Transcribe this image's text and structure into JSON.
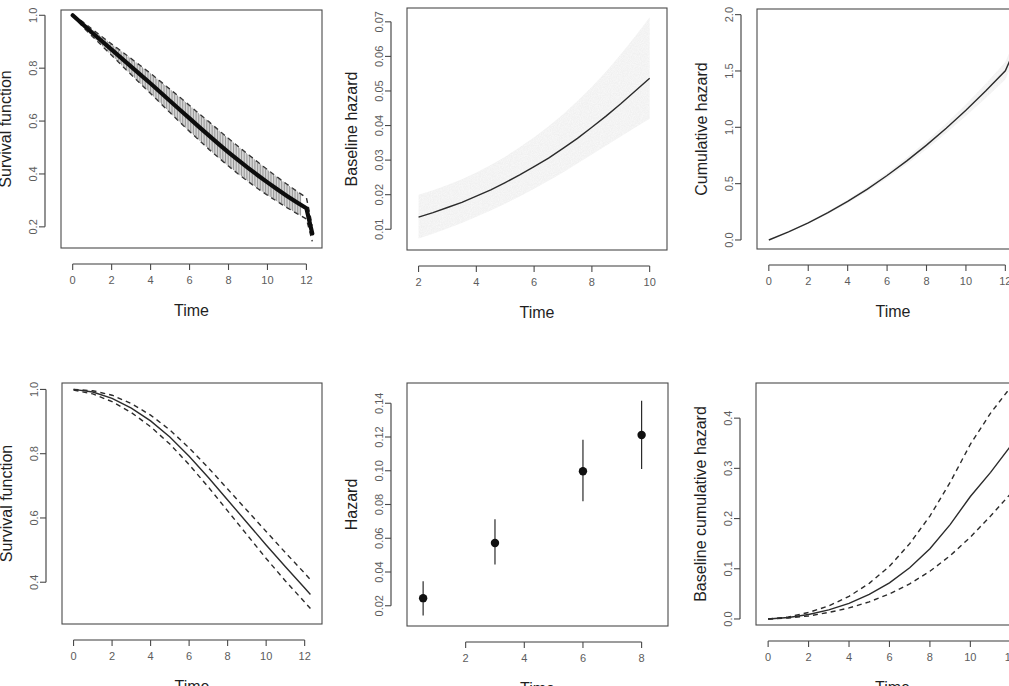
{
  "figure": {
    "panel_count": 6,
    "layout": "2 rows x 3 columns",
    "background": "#ffffff",
    "line_color": "#2b2b2b",
    "band_color": "#e9e9e9"
  },
  "chart_data": [
    {
      "id": "panel-1",
      "type": "line",
      "title": "",
      "xlabel": "Time",
      "ylabel": "Survival function",
      "xlim": [
        -0.6,
        12.8
      ],
      "ylim": [
        0.12,
        1.02
      ],
      "xticks": [
        0,
        2,
        4,
        6,
        8,
        10,
        12
      ],
      "xticklabels": [
        "0",
        "2",
        "4",
        "6",
        "8",
        "10",
        "12"
      ],
      "yticks": [
        0.2,
        0.4,
        0.6,
        0.8,
        1.0
      ],
      "yticklabels": [
        "0.2",
        "0.4",
        "0.6",
        "0.8",
        "1.0"
      ],
      "grid": false,
      "legend": "none",
      "style": "thick black curve with dense vertical error bars",
      "x": [
        0,
        0.5,
        1,
        1.5,
        2,
        2.5,
        3,
        3.5,
        4,
        4.5,
        5,
        5.5,
        6,
        6.5,
        7,
        7.5,
        8,
        8.5,
        9,
        9.5,
        10,
        10.5,
        11,
        11.5,
        12,
        12.3
      ],
      "values": [
        1.0,
        0.967,
        0.934,
        0.902,
        0.87,
        0.838,
        0.806,
        0.774,
        0.742,
        0.709,
        0.676,
        0.643,
        0.61,
        0.577,
        0.545,
        0.513,
        0.482,
        0.452,
        0.423,
        0.395,
        0.368,
        0.342,
        0.317,
        0.293,
        0.27,
        0.175
      ],
      "ci_lower": [
        1.0,
        0.958,
        0.921,
        0.885,
        0.849,
        0.812,
        0.776,
        0.74,
        0.704,
        0.668,
        0.632,
        0.596,
        0.561,
        0.527,
        0.493,
        0.461,
        0.43,
        0.4,
        0.372,
        0.345,
        0.32,
        0.296,
        0.273,
        0.251,
        0.23,
        0.145
      ],
      "ci_upper": [
        1.0,
        0.976,
        0.947,
        0.919,
        0.891,
        0.864,
        0.836,
        0.808,
        0.78,
        0.75,
        0.72,
        0.69,
        0.659,
        0.627,
        0.597,
        0.565,
        0.534,
        0.504,
        0.474,
        0.445,
        0.416,
        0.388,
        0.361,
        0.335,
        0.31,
        0.205
      ]
    },
    {
      "id": "panel-2",
      "type": "line",
      "title": "",
      "xlabel": "Time",
      "ylabel": "Baseline hazard",
      "xlim": [
        1.6,
        10.6
      ],
      "ylim": [
        0.004,
        0.074
      ],
      "xticks": [
        2,
        4,
        6,
        8,
        10
      ],
      "xticklabels": [
        "2",
        "4",
        "6",
        "8",
        "10"
      ],
      "yticks": [
        0.01,
        0.02,
        0.03,
        0.04,
        0.05,
        0.06,
        0.07
      ],
      "yticklabels": [
        "0.01",
        "0.02",
        "0.03",
        "0.04",
        "0.05",
        "0.06",
        "0.07"
      ],
      "grid": false,
      "legend": "none",
      "style": "solid curve with stippled gray confidence band",
      "x": [
        2,
        2.5,
        3,
        3.5,
        4,
        4.5,
        5,
        5.5,
        6,
        6.5,
        7,
        7.5,
        8,
        8.5,
        9,
        9.5,
        10
      ],
      "values": [
        0.0135,
        0.0148,
        0.0163,
        0.0178,
        0.0196,
        0.0214,
        0.0235,
        0.0257,
        0.0281,
        0.0306,
        0.0334,
        0.0363,
        0.0395,
        0.0428,
        0.0463,
        0.05,
        0.0537
      ],
      "ci_lower": [
        0.0073,
        0.0087,
        0.0102,
        0.0118,
        0.0136,
        0.0154,
        0.0174,
        0.0195,
        0.0217,
        0.024,
        0.0264,
        0.029,
        0.0316,
        0.0342,
        0.0368,
        0.0394,
        0.042
      ],
      "ci_upper": [
        0.02,
        0.0213,
        0.0228,
        0.0245,
        0.0264,
        0.0286,
        0.031,
        0.0337,
        0.0366,
        0.0398,
        0.0433,
        0.0471,
        0.0512,
        0.0557,
        0.0606,
        0.0658,
        0.0713
      ]
    },
    {
      "id": "panel-3",
      "type": "line",
      "title": "",
      "xlabel": "Time",
      "ylabel": "Cumulative hazard",
      "xlim": [
        -0.6,
        13.2
      ],
      "ylim": [
        -0.08,
        2.05
      ],
      "xticks": [
        0,
        2,
        4,
        6,
        8,
        10,
        12
      ],
      "xticklabels": [
        "0",
        "2",
        "4",
        "6",
        "8",
        "10",
        "12"
      ],
      "yticks": [
        0.0,
        0.5,
        1.0,
        1.5,
        2.0
      ],
      "yticklabels": [
        "0.0",
        "0.5",
        "1.0",
        "1.5",
        "2.0"
      ],
      "grid": false,
      "legend": "none",
      "clipped_right_edge": true,
      "style": "solid curve with narrow stippled gray confidence band",
      "x": [
        0,
        1,
        2,
        3,
        4,
        5,
        6,
        7,
        8,
        9,
        10,
        11,
        12,
        12.6
      ],
      "values": [
        0.0,
        0.072,
        0.152,
        0.242,
        0.342,
        0.452,
        0.572,
        0.702,
        0.842,
        0.992,
        1.152,
        1.322,
        1.502,
        1.74
      ],
      "ci_lower": [
        0.0,
        0.068,
        0.144,
        0.23,
        0.326,
        0.432,
        0.548,
        0.672,
        0.806,
        0.95,
        1.1,
        1.258,
        1.424,
        1.66
      ],
      "ci_upper": [
        0.0,
        0.076,
        0.16,
        0.254,
        0.358,
        0.472,
        0.596,
        0.732,
        0.878,
        1.034,
        1.204,
        1.386,
        1.58,
        1.82
      ]
    },
    {
      "id": "panel-4",
      "type": "line",
      "title": "",
      "xlabel": "Time",
      "ylabel": "Survival function",
      "xlim": [
        -0.6,
        12.9
      ],
      "ylim": [
        0.27,
        1.02
      ],
      "xticks": [
        0,
        2,
        4,
        6,
        8,
        10,
        12
      ],
      "xticklabels": [
        "0",
        "2",
        "4",
        "6",
        "8",
        "10",
        "12"
      ],
      "yticks": [
        0.4,
        0.6,
        0.8,
        1.0
      ],
      "yticklabels": [
        "0.4",
        "0.6",
        "0.8",
        "1.0"
      ],
      "grid": false,
      "legend": "none",
      "style": "solid curve with dashed confidence limits",
      "x": [
        0,
        1,
        2,
        3,
        4,
        5,
        6,
        7,
        8,
        9,
        10,
        11,
        12,
        12.3
      ],
      "values": [
        1.0,
        0.992,
        0.972,
        0.942,
        0.902,
        0.852,
        0.792,
        0.726,
        0.656,
        0.586,
        0.516,
        0.448,
        0.382,
        0.362
      ],
      "ci_lower": [
        0.998,
        0.986,
        0.962,
        0.928,
        0.884,
        0.83,
        0.766,
        0.696,
        0.622,
        0.548,
        0.474,
        0.404,
        0.338,
        0.318
      ],
      "ci_upper": [
        1.0,
        0.996,
        0.982,
        0.956,
        0.92,
        0.874,
        0.818,
        0.756,
        0.69,
        0.624,
        0.558,
        0.492,
        0.428,
        0.408
      ]
    },
    {
      "id": "panel-5",
      "type": "scatter",
      "title": "",
      "xlabel": "Time",
      "ylabel": "Hazard",
      "xlim": [
        0.0,
        8.9
      ],
      "ylim": [
        0.008,
        0.152
      ],
      "xticks": [
        2,
        4,
        6,
        8
      ],
      "xticklabels": [
        "2",
        "4",
        "6",
        "8"
      ],
      "yticks": [
        0.02,
        0.04,
        0.06,
        0.08,
        0.1,
        0.12,
        0.14
      ],
      "yticklabels": [
        "0.02",
        "0.04",
        "0.06",
        "0.08",
        "0.10",
        "0.12",
        "0.14"
      ],
      "grid": false,
      "legend": "none",
      "style": "point estimates with vertical error bars",
      "x": [
        0.55,
        3.0,
        6.0,
        8.0
      ],
      "values": [
        0.0245,
        0.0572,
        0.0997,
        0.1212
      ],
      "ci_lower": [
        0.0142,
        0.0444,
        0.082,
        0.101
      ],
      "ci_upper": [
        0.0345,
        0.0713,
        0.1183,
        0.1415
      ]
    },
    {
      "id": "panel-6",
      "type": "line",
      "title": "",
      "xlabel": "Time",
      "ylabel": "Baseline cumulative hazard",
      "xlim": [
        -0.6,
        12.9
      ],
      "ylim": [
        -0.012,
        0.47
      ],
      "xticks": [
        0,
        2,
        4,
        6,
        8,
        10,
        12
      ],
      "xticklabels": [
        "0",
        "2",
        "4",
        "6",
        "8",
        "10",
        "12"
      ],
      "yticks": [
        0.0,
        0.1,
        0.2,
        0.3,
        0.4
      ],
      "yticklabels": [
        "0.0",
        "0.1",
        "0.2",
        "0.3",
        "0.4"
      ],
      "grid": false,
      "legend": "none",
      "style": "solid curve with dashed confidence limits",
      "x": [
        0,
        1,
        2,
        3,
        4,
        5,
        6,
        7,
        8,
        9,
        10,
        11,
        12,
        12.3
      ],
      "values": [
        0.0,
        0.003,
        0.009,
        0.018,
        0.031,
        0.049,
        0.072,
        0.102,
        0.14,
        0.188,
        0.244,
        0.292,
        0.345,
        0.352
      ],
      "ci_lower": [
        0.0,
        0.002,
        0.006,
        0.013,
        0.022,
        0.034,
        0.05,
        0.07,
        0.095,
        0.126,
        0.163,
        0.205,
        0.25,
        0.258
      ],
      "ci_upper": [
        0.0,
        0.004,
        0.013,
        0.026,
        0.045,
        0.071,
        0.105,
        0.15,
        0.205,
        0.272,
        0.348,
        0.41,
        0.462,
        0.47
      ]
    }
  ]
}
